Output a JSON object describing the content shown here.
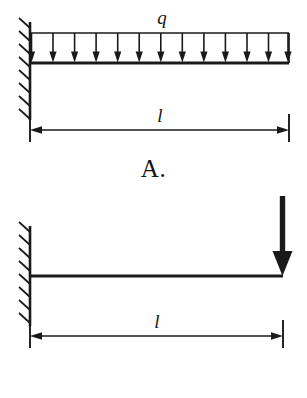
{
  "figures": [
    {
      "id": "A",
      "caption": "A.",
      "support": "fixed-wall-left",
      "beam": "cantilever",
      "load": {
        "type": "uniformly-distributed-load",
        "symbol": "q",
        "arrow_count": 13,
        "direction": "down"
      },
      "dimension": {
        "symbol": "l",
        "style": "double-headed-arrow",
        "spans": "wall-face-to-free-end"
      }
    },
    {
      "id": "C",
      "caption": "C.",
      "support": "fixed-wall-left",
      "beam": "cantilever",
      "load": {
        "type": "concentrated-point-load",
        "symbol": "",
        "arrow_count": 1,
        "direction": "down",
        "position": "free-end"
      },
      "dimension": {
        "symbol": "l",
        "style": "double-headed-arrow",
        "spans": "wall-face-to-free-end"
      }
    }
  ],
  "colors": {
    "background": "#ffffff",
    "ink": "#141414",
    "line": "#1a1a1a"
  }
}
